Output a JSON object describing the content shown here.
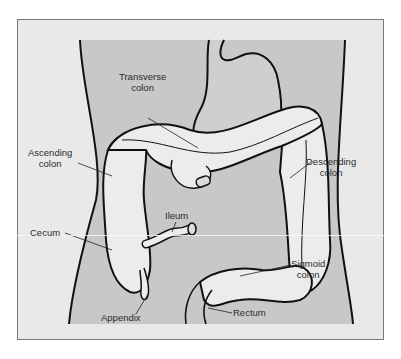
{
  "figure": {
    "colors": {
      "frame_bg": "#e9e9e9",
      "body_bg": "#c8c8c8",
      "organ_fill": "#ececec",
      "outline": "#111111",
      "label_text": "#2a2a2a"
    }
  },
  "labels": {
    "transverse_colon": {
      "line1": "Transverse",
      "line2": "colon"
    },
    "ascending_colon": {
      "line1": "Ascending",
      "line2": "colon"
    },
    "descending_colon": {
      "line1": "Descending",
      "line2": "colon"
    },
    "ileum": {
      "line1": "Ileum"
    },
    "cecum": {
      "line1": "Cecum"
    },
    "sigmoid_colon": {
      "line1": "Sigmoid",
      "line2": "colon"
    },
    "appendix": {
      "line1": "Appendix"
    },
    "rectum": {
      "line1": "Rectum"
    }
  }
}
